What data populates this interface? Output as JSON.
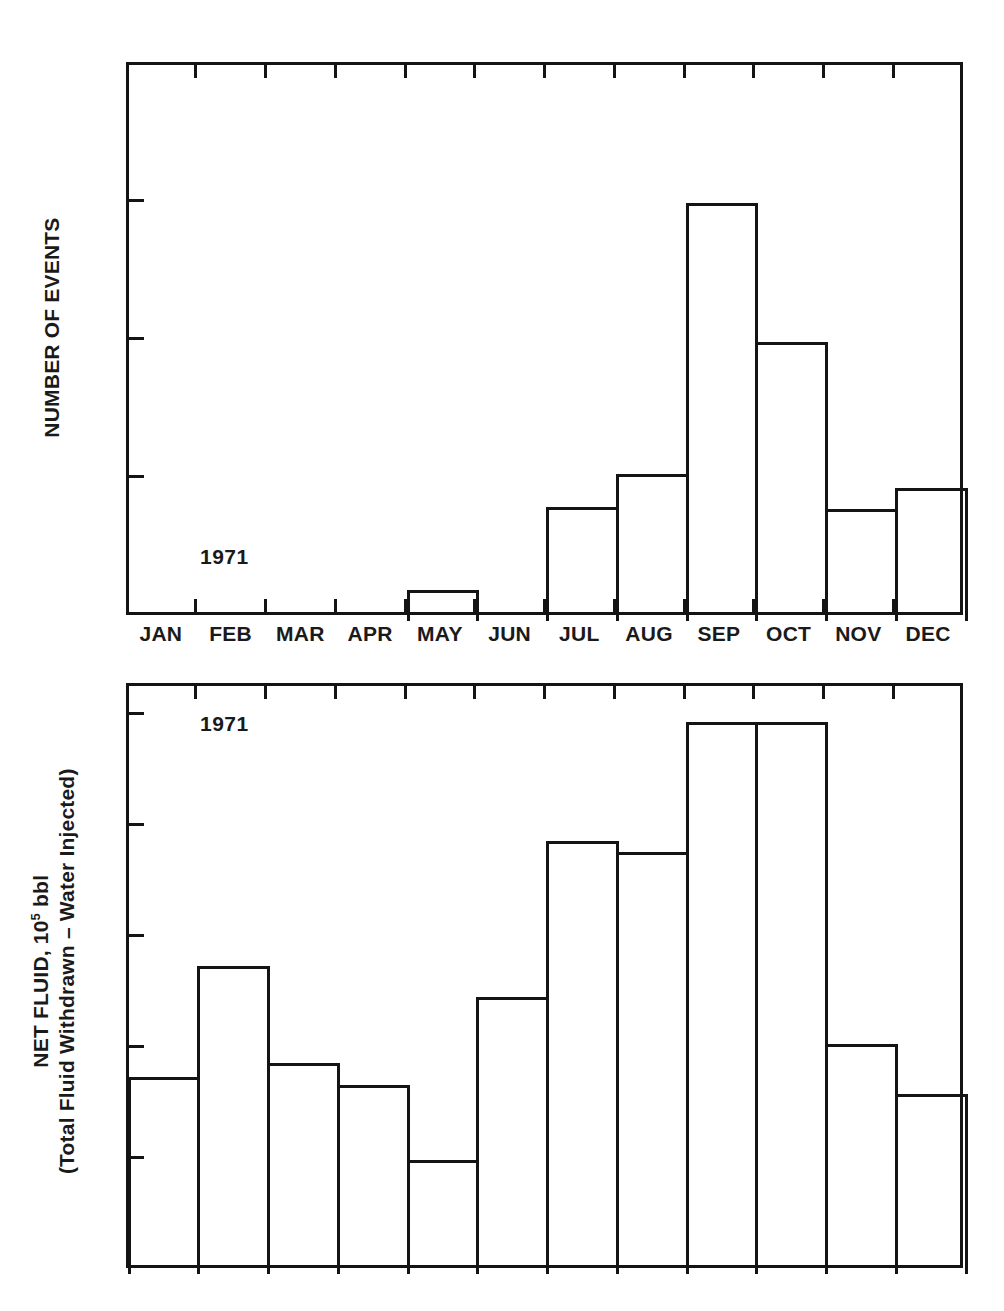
{
  "page": {
    "corner_mark": "",
    "background": "#ffffff",
    "ink": "#141414"
  },
  "chart_data": [
    {
      "id": "events-1971",
      "type": "bar",
      "title": "",
      "annotation": "1971",
      "xlabel": "",
      "ylabel": "NUMBER OF EVENTS",
      "ylabel_line1": "NUMBER OF EVENTS",
      "ylabel_line2": "",
      "categories": [
        "JAN",
        "FEB",
        "MAR",
        "APR",
        "MAY",
        "JUN",
        "JUL",
        "AUG",
        "SEP",
        "OCT",
        "NOV",
        "DEC"
      ],
      "values": [
        0,
        0,
        0,
        0,
        1,
        0,
        4,
        5.2,
        15,
        10,
        3.95,
        4.7
      ],
      "ylim": [
        0,
        20
      ],
      "yticks": [
        0,
        5,
        10,
        15,
        20
      ],
      "ytick_labels": [
        "0",
        "5",
        "10",
        "15",
        "20"
      ],
      "grid": false,
      "legend": "none",
      "bar_style": "outline"
    },
    {
      "id": "net-fluid-1971",
      "type": "bar",
      "title": "",
      "annotation": "1971",
      "xlabel": "",
      "ylabel": "NET FLUID, 10^5 bbl (Total Fluid Withdrawn – Water Injected)",
      "ylabel_line1_pre": "NET FLUID, 10",
      "ylabel_line1_sup": "5",
      "ylabel_line1_post": " bbl",
      "ylabel_line2": "(Total Fluid Withdrawn – Water Injected)",
      "categories": [
        "JAN",
        "FEB",
        "MAR",
        "APR",
        "MAY",
        "JUN",
        "JUL",
        "AUG",
        "SEP",
        "OCT",
        "NOV",
        "DEC"
      ],
      "values": [
        3.5,
        5.5,
        3.75,
        3.35,
        2.0,
        4.95,
        7.75,
        7.55,
        9.9,
        9.9,
        4.1,
        3.2
      ],
      "ylim": [
        0,
        10.55
      ],
      "yticks": [
        0,
        2,
        4,
        6,
        8,
        10
      ],
      "ytick_labels": [
        "0",
        "2",
        "4",
        "6",
        "8",
        "10"
      ],
      "grid": false,
      "legend": "none",
      "bar_style": "outline"
    }
  ]
}
